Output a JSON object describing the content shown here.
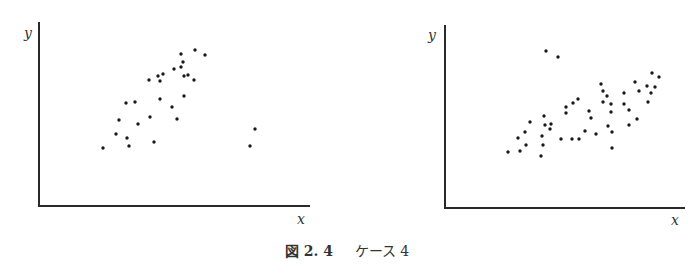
{
  "caption": {
    "figure_label": "図 2. 4",
    "title": "ケース 4"
  },
  "chart_data": [
    {
      "type": "scatter",
      "title": "",
      "xlabel": "x",
      "ylabel": "y",
      "grid": false,
      "legend": null,
      "axis_box": {
        "x0": 39,
        "y0": 206,
        "x1": 310,
        "ytop": 22
      },
      "points_px": [
        [
          103,
          148
        ],
        [
          116,
          134
        ],
        [
          119,
          120
        ],
        [
          127,
          138
        ],
        [
          129,
          146
        ],
        [
          126,
          103
        ],
        [
          135,
          102
        ],
        [
          138,
          124
        ],
        [
          149,
          80
        ],
        [
          150,
          117
        ],
        [
          154,
          142
        ],
        [
          158,
          76
        ],
        [
          160,
          81
        ],
        [
          160,
          99
        ],
        [
          163,
          74
        ],
        [
          172,
          107
        ],
        [
          174,
          69
        ],
        [
          177,
          119
        ],
        [
          181,
          67
        ],
        [
          181,
          54
        ],
        [
          183,
          62
        ],
        [
          184,
          76
        ],
        [
          184,
          96
        ],
        [
          188,
          75
        ],
        [
          194,
          80
        ],
        [
          195,
          50
        ],
        [
          205,
          55
        ],
        [
          250,
          146
        ],
        [
          255,
          129
        ]
      ]
    },
    {
      "type": "scatter",
      "title": "",
      "xlabel": "x",
      "ylabel": "y",
      "grid": false,
      "legend": null,
      "axis_box": {
        "x0": 445,
        "y0": 208,
        "x1": 685,
        "ytop": 25
      },
      "points_px": [
        [
          508,
          152
        ],
        [
          518,
          138
        ],
        [
          520,
          151
        ],
        [
          525,
          132
        ],
        [
          526,
          145
        ],
        [
          530,
          122
        ],
        [
          541,
          156
        ],
        [
          542,
          136
        ],
        [
          543,
          145
        ],
        [
          544,
          116
        ],
        [
          545,
          125
        ],
        [
          546,
          51
        ],
        [
          550,
          129
        ],
        [
          551,
          124
        ],
        [
          558,
          57
        ],
        [
          561,
          139
        ],
        [
          566,
          113
        ],
        [
          566,
          107
        ],
        [
          572,
          139
        ],
        [
          573,
          103
        ],
        [
          578,
          99
        ],
        [
          579,
          139
        ],
        [
          585,
          131
        ],
        [
          589,
          111
        ],
        [
          591,
          118
        ],
        [
          596,
          134
        ],
        [
          601,
          84
        ],
        [
          603,
          91
        ],
        [
          607,
          96
        ],
        [
          603,
          102
        ],
        [
          608,
          126
        ],
        [
          611,
          104
        ],
        [
          611,
          112
        ],
        [
          612,
          148
        ],
        [
          612,
          132
        ],
        [
          624,
          93
        ],
        [
          624,
          104
        ],
        [
          629,
          110
        ],
        [
          629,
          125
        ],
        [
          635,
          82
        ],
        [
          639,
          91
        ],
        [
          637,
          119
        ],
        [
          647,
          86
        ],
        [
          648,
          102
        ],
        [
          651,
          93
        ],
        [
          652,
          73
        ],
        [
          655,
          87
        ],
        [
          659,
          77
        ]
      ]
    }
  ]
}
